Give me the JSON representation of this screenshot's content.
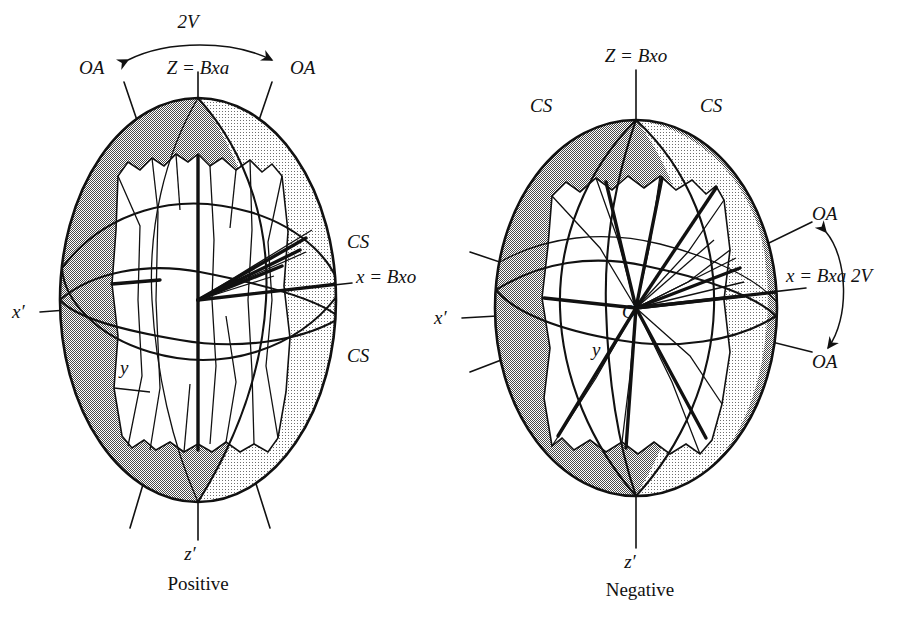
{
  "colors": {
    "ink": "#111111",
    "shade_dark": "#a9a9a9",
    "shade_light": "#dcdcdc",
    "shade_mid": "#c4c4c4",
    "paper": "#ffffff"
  },
  "diagrams": [
    {
      "id": "positive",
      "caption": "Positive",
      "labels": {
        "angle": "2V",
        "optic_axis_left": "OA",
        "optic_axis_right": "OA",
        "z_axis": "Z =  Bxa",
        "cs_upper": "CS",
        "cs_lower": "CS",
        "x_axis": "x = Bxo",
        "x_prime": "x′",
        "y_axis": "y",
        "z_prime": "z′"
      }
    },
    {
      "id": "negative",
      "caption": "Negative",
      "labels": {
        "angle": "2V",
        "optic_axis_upper": "OA",
        "optic_axis_lower": "OA",
        "z_axis": "Z =  Bxo",
        "cs_left": "CS",
        "cs_right": "CS",
        "x_axis": "x = Bxa 2V",
        "x_prime": "x′",
        "y_axis": "y",
        "origin": "O",
        "z_prime": "z′"
      }
    }
  ]
}
